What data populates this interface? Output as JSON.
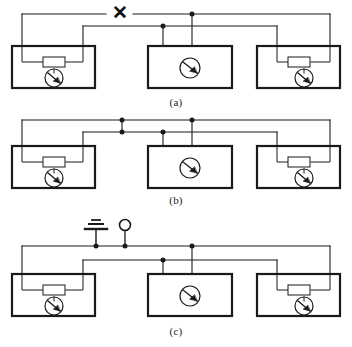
{
  "figure": {
    "background_color": "#ffffff",
    "line_color": "#1a1a1a",
    "panel_count": 3
  },
  "panels": [
    {
      "id": "panel-a",
      "caption": "(a)",
      "has_fault_mark": true,
      "fault_mark_symbol": "✕",
      "fault_mark_name": "open-circuit-cross",
      "has_ground_symbol": false,
      "has_terminal_circle": false,
      "junction_dot_count": 2,
      "blocks": [
        {
          "name": "left-block",
          "has_resistor": true,
          "has_transistor": true
        },
        {
          "name": "center-block",
          "has_resistor": false,
          "has_transistor": true
        },
        {
          "name": "right-block",
          "has_resistor": true,
          "has_transistor": true
        }
      ]
    },
    {
      "id": "panel-b",
      "caption": "(b)",
      "has_fault_mark": false,
      "fault_mark_symbol": "",
      "fault_mark_name": "",
      "has_ground_symbol": false,
      "has_terminal_circle": false,
      "junction_dot_count": 4,
      "blocks": [
        {
          "name": "left-block",
          "has_resistor": true,
          "has_transistor": true
        },
        {
          "name": "center-block",
          "has_resistor": false,
          "has_transistor": true
        },
        {
          "name": "right-block",
          "has_resistor": true,
          "has_transistor": true
        }
      ]
    },
    {
      "id": "panel-c",
      "caption": "(c)",
      "has_fault_mark": false,
      "fault_mark_symbol": "",
      "fault_mark_name": "",
      "has_ground_symbol": true,
      "has_terminal_circle": true,
      "junction_dot_count": 4,
      "blocks": [
        {
          "name": "left-block",
          "has_resistor": true,
          "has_transistor": true
        },
        {
          "name": "center-block",
          "has_resistor": false,
          "has_transistor": true
        },
        {
          "name": "right-block",
          "has_resistor": true,
          "has_transistor": true
        }
      ]
    }
  ],
  "symbols": {
    "ground": {
      "name": "earth-ground-symbol",
      "bar_count": 3
    },
    "terminal": {
      "name": "open-terminal-circle",
      "shape": "circle"
    },
    "transistor": {
      "name": "transistor-symbol",
      "shape": "circled-bjt"
    },
    "resistor": {
      "name": "resistor-symbol",
      "shape": "rectangle"
    },
    "junction": {
      "name": "junction-dot",
      "shape": "filled-circle"
    }
  }
}
